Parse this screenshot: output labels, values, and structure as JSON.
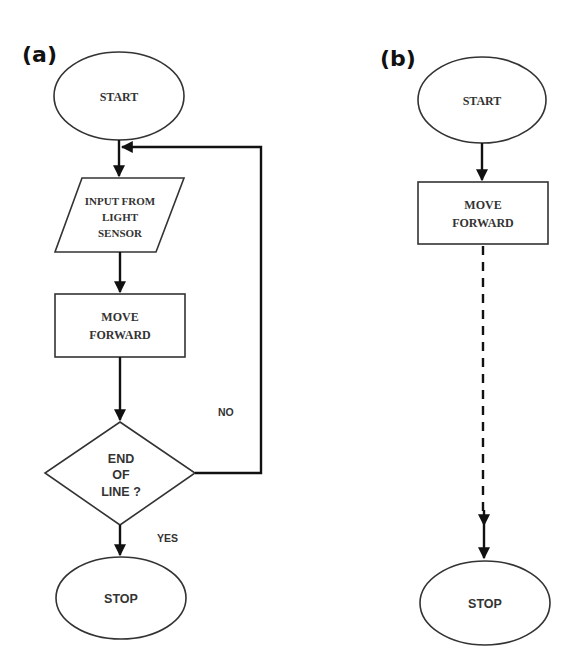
{
  "panels": {
    "a": {
      "label": "(a)",
      "start": "START",
      "input": [
        "INPUT FROM",
        "LIGHT",
        "SENSOR"
      ],
      "process": [
        "MOVE",
        "FORWARD"
      ],
      "decision": [
        "END",
        "OF",
        "LINE ?"
      ],
      "no_label": "NO",
      "yes_label": "YES",
      "stop": "STOP"
    },
    "b": {
      "label": "(b)",
      "start": "START",
      "process": [
        "MOVE",
        "FORWARD"
      ],
      "stop": "STOP"
    }
  },
  "colors": {
    "line": "#111111",
    "shape_stroke": "#333333",
    "background": "#ffffff"
  }
}
